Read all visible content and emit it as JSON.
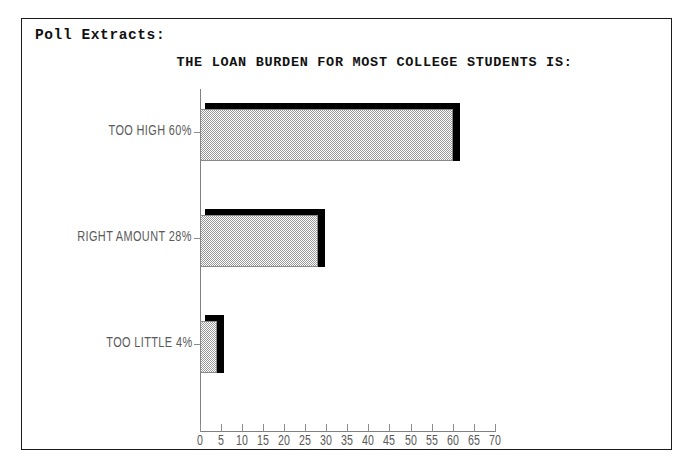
{
  "panel": {
    "heading": "Poll Extracts:"
  },
  "chart_data": {
    "type": "bar",
    "orientation": "horizontal",
    "title": "THE LOAN BURDEN FOR MOST COLLEGE STUDENTS IS:",
    "xlabel": "",
    "ylabel": "",
    "categories": [
      "TOO HIGH",
      "RIGHT AMOUNT",
      "TOO LITTLE"
    ],
    "values": [
      60,
      28,
      4
    ],
    "category_labels": [
      "TOO HIGH 60%",
      "RIGHT AMOUNT 28%",
      "TOO LITTLE 4%"
    ],
    "value_labels": [
      "60%",
      "28%",
      "4%"
    ],
    "xlim": [
      0,
      70
    ],
    "xticks": [
      0,
      5,
      10,
      15,
      20,
      25,
      30,
      35,
      40,
      45,
      50,
      55,
      60,
      65,
      70
    ],
    "xtick_labels": [
      "0",
      "5",
      "10",
      "15",
      "20",
      "25",
      "30",
      "35",
      "40",
      "45",
      "50",
      "55",
      "60",
      "65",
      "70"
    ],
    "grid": false,
    "legend": null,
    "bar_fill": "#9a9a9a",
    "bar_fill_style": "checker-dither",
    "bar_shadow_color": "#000000",
    "axis_color": "#808080",
    "text_color": "#5a5a5a",
    "title_color": "#111111",
    "background": "#ffffff"
  }
}
